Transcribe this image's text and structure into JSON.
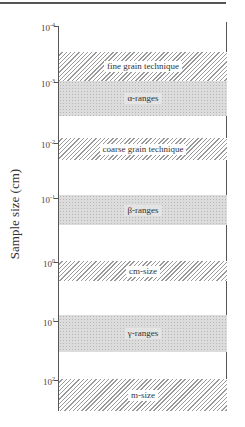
{
  "chart_data": {
    "type": "range-bands",
    "ylabel": "Sample size  (cm)",
    "axis": {
      "scale": "log",
      "direction": "top-to-bottom increasing",
      "ticks": [
        {
          "base": "10",
          "exp": "-4",
          "y": 26
        },
        {
          "base": "10",
          "exp": "-3",
          "y": 82
        },
        {
          "base": "10",
          "exp": "-2",
          "y": 143
        },
        {
          "base": "10",
          "exp": "-1",
          "y": 198
        },
        {
          "base": "10",
          "exp": "0",
          "y": 262
        },
        {
          "base": "10",
          "exp": "1",
          "y": 321
        },
        {
          "base": "10",
          "exp": "2",
          "y": 380
        }
      ]
    },
    "bands": [
      {
        "label": "fine grain technique",
        "style": "hatch",
        "top": 52,
        "height": 29,
        "range_cm": [
          0.0003,
          0.001
        ]
      },
      {
        "label": "α-ranges",
        "style": "dot",
        "top": 81,
        "height": 35,
        "range_cm": [
          0.001,
          0.004
        ]
      },
      {
        "label": "coarse grain technique",
        "style": "hatch",
        "top": 138,
        "height": 22,
        "range_cm": [
          0.008,
          0.02
        ]
      },
      {
        "label": "β-ranges",
        "style": "dot",
        "top": 195,
        "height": 30,
        "range_cm": [
          0.08,
          0.3
        ]
      },
      {
        "label": "cm-size",
        "style": "hatch",
        "top": 261,
        "height": 20,
        "range_cm": [
          1,
          2
        ]
      },
      {
        "label": "γ-ranges",
        "style": "dot",
        "top": 315,
        "height": 37,
        "range_cm": [
          8,
          30
        ]
      },
      {
        "label": "m-size",
        "style": "hatch",
        "top": 379,
        "height": 32,
        "range_cm": [
          100,
          300
        ]
      }
    ]
  }
}
